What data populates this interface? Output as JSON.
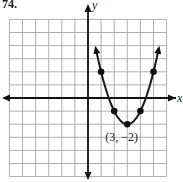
{
  "problem_label": "74.",
  "chart_data": {
    "type": "line",
    "title": "",
    "xlabel": "x",
    "ylabel": "y",
    "equation_form": "y = (x - 3)^2 - 2",
    "xlim": [
      -6,
      6
    ],
    "ylim": [
      -6,
      6
    ],
    "grid": true,
    "annotations": [
      {
        "text": "(3, −2)",
        "x": 3,
        "y": -2
      }
    ],
    "marked_points": [
      {
        "x": 1,
        "y": 2
      },
      {
        "x": 2,
        "y": -1
      },
      {
        "x": 3,
        "y": -2
      },
      {
        "x": 4,
        "y": -1
      },
      {
        "x": 5,
        "y": 2
      }
    ],
    "series": [
      {
        "name": "parabola",
        "x": [
          0.6,
          1,
          2,
          3,
          4,
          5,
          5.4
        ],
        "y": [
          3.76,
          2,
          -1,
          -2,
          -1,
          2,
          3.76
        ]
      }
    ]
  },
  "vertex_label": "(3, −2)",
  "x_axis_label": "x",
  "y_axis_label": "y"
}
